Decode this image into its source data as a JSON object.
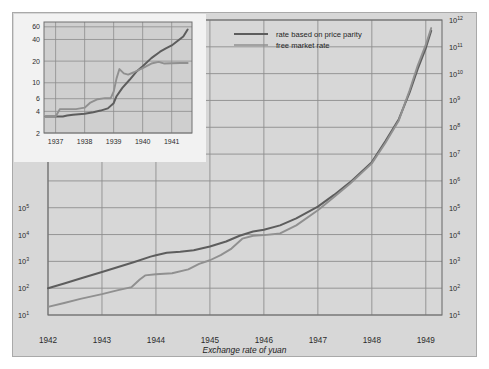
{
  "figure": {
    "caption": "Exchange rate of yuan",
    "background_color": "#d7d7d7",
    "grid_color": "#8d8d8d"
  },
  "legend": {
    "position": "top-center",
    "items": [
      {
        "label": "rate based on price parity",
        "color": "#5d5d5d"
      },
      {
        "label": "free market rate",
        "color": "#909090"
      }
    ]
  },
  "axis_title": {
    "line1": "yuan equivalent",
    "line2": "of US dollar",
    "line3": "(logarithmic scale)"
  },
  "chart_data": {
    "type": "line",
    "title": "",
    "subtitle": "",
    "xlabel": "Exchange rate of yuan",
    "ylabel": "yuan equivalent of US dollar (logarithmic scale)",
    "yscale": "log",
    "ylim": [
      10,
      1000000000000
    ],
    "xlim": [
      1942.0,
      1949.3
    ],
    "grid": true,
    "legend_position": "top-center",
    "y_tick_labels_left": [
      "10^1",
      "10^2",
      "10^3",
      "10^4",
      "10^5"
    ],
    "y_tick_labels_right": [
      "10^1",
      "10^2",
      "10^3",
      "10^4",
      "10^5",
      "10^6",
      "10^7",
      "10^8",
      "10^9",
      "10^10",
      "10^11",
      "10^12"
    ],
    "y_tick_values": [
      10,
      100,
      1000,
      10000,
      100000,
      1000000,
      10000000,
      100000000,
      1000000000,
      10000000000,
      100000000000,
      1000000000000
    ],
    "x_tick_labels": [
      "1942",
      "1943",
      "1944",
      "1945",
      "1946",
      "1947",
      "1948",
      "1949"
    ],
    "x_tick_values": [
      1942,
      1943,
      1944,
      1945,
      1946,
      1947,
      1948,
      1949
    ],
    "series": [
      {
        "name": "rate based on price parity",
        "color": "#5d5d5d",
        "x": [
          1942.0,
          1942.3,
          1942.6,
          1943.0,
          1943.3,
          1943.6,
          1943.9,
          1944.0,
          1944.2,
          1944.45,
          1944.7,
          1945.0,
          1945.3,
          1945.55,
          1945.8,
          1946.0,
          1946.3,
          1946.6,
          1947.0,
          1947.3,
          1947.6,
          1948.0,
          1948.25,
          1948.5,
          1948.7,
          1948.85,
          1949.0,
          1949.1
        ],
        "y": [
          100,
          150,
          230,
          400,
          620,
          950,
          1500,
          1700,
          2100,
          2300,
          2600,
          3600,
          5500,
          9000,
          13000,
          15000,
          22000,
          40000,
          110000,
          300000,
          900000,
          5000000,
          30000000,
          200000000,
          2000000000,
          15000000000,
          90000000000,
          400000000000
        ]
      },
      {
        "name": "free market rate",
        "color": "#909090",
        "x": [
          1942.0,
          1942.3,
          1942.6,
          1943.0,
          1943.3,
          1943.55,
          1943.7,
          1943.8,
          1944.0,
          1944.3,
          1944.6,
          1944.8,
          1945.0,
          1945.2,
          1945.4,
          1945.6,
          1945.8,
          1946.0,
          1946.3,
          1946.6,
          1947.0,
          1947.3,
          1947.6,
          1948.0,
          1948.25,
          1948.5,
          1948.7,
          1948.85,
          1949.0,
          1949.1
        ],
        "y": [
          20,
          28,
          40,
          60,
          85,
          110,
          210,
          300,
          330,
          360,
          500,
          800,
          1100,
          1700,
          3000,
          7000,
          9000,
          9500,
          11000,
          22000,
          80000,
          250000,
          800000,
          4500000,
          26000000,
          180000000,
          2400000000,
          20000000000,
          120000000000,
          500000000000
        ]
      }
    ]
  },
  "inset": {
    "background_color": "#f2f2f2",
    "plot_background_color": "#cfcfcf",
    "chart_data": {
      "type": "line",
      "yscale": "log",
      "ylim": [
        2,
        70
      ],
      "xlim": [
        1936.6,
        1941.7
      ],
      "grid": true,
      "y_tick_labels": [
        "60",
        "40",
        "20",
        "10",
        "6",
        "4",
        "2"
      ],
      "y_tick_values": [
        60,
        40,
        20,
        10,
        6,
        4,
        2
      ],
      "x_tick_labels": [
        "1937",
        "1938",
        "1939",
        "1940",
        "1941"
      ],
      "x_tick_values": [
        1937,
        1938,
        1939,
        1940,
        1941
      ],
      "series": [
        {
          "name": "rate based on price parity",
          "color": "#5d5d5d",
          "x": [
            1936.65,
            1937.0,
            1937.25,
            1937.4,
            1937.6,
            1938.0,
            1938.3,
            1938.55,
            1938.8,
            1939.0,
            1939.1,
            1939.3,
            1939.55,
            1939.8,
            1940.0,
            1940.3,
            1940.6,
            1940.8,
            1941.0,
            1941.2,
            1941.4,
            1941.55
          ],
          "y": [
            3.4,
            3.4,
            3.4,
            3.5,
            3.6,
            3.7,
            3.9,
            4.1,
            4.4,
            5.2,
            6.5,
            8.5,
            11.0,
            14.5,
            17.0,
            22.0,
            27.0,
            30.0,
            33.0,
            38.0,
            44.0,
            55.0
          ]
        },
        {
          "name": "free market rate",
          "color": "#909090",
          "x": [
            1936.65,
            1937.0,
            1937.15,
            1937.3,
            1937.45,
            1937.7,
            1938.0,
            1938.2,
            1938.45,
            1938.7,
            1938.9,
            1939.0,
            1939.1,
            1939.2,
            1939.35,
            1939.5,
            1939.7,
            1940.0,
            1940.3,
            1940.55,
            1940.75,
            1941.0,
            1941.3,
            1941.55
          ],
          "y": [
            3.4,
            3.4,
            4.3,
            4.3,
            4.3,
            4.3,
            4.5,
            5.3,
            5.9,
            6.1,
            6.1,
            7.5,
            11.5,
            15.5,
            13.5,
            13.0,
            14.0,
            16.0,
            18.5,
            19.5,
            18.5,
            18.7,
            18.8,
            18.8
          ]
        }
      ]
    }
  }
}
